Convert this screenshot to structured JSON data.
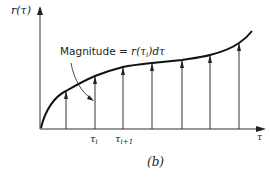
{
  "diagram": {
    "y_axis_label": "r(τ)",
    "x_axis_label": "τ",
    "annotation": {
      "prefix": "Magnitude = ",
      "formula_r": "r(τ",
      "formula_sub": "i",
      "formula_tail": ")dτ"
    },
    "tick_labels": {
      "tau_i": "τ",
      "tau_i_sub": "i",
      "tau_i1": "τ",
      "tau_i1_sub": "i+1"
    },
    "caption": "(b)",
    "impulse_x": [
      66,
      95,
      123,
      152,
      182,
      210,
      239
    ],
    "curve_color": "#111111"
  }
}
